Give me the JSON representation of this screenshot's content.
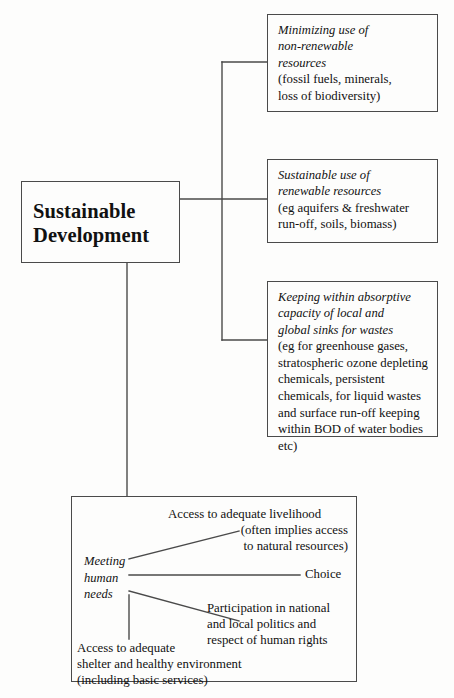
{
  "diagram": {
    "title": "Sustainable Development",
    "root": {
      "line1": "Sustainable",
      "line2": "Development"
    },
    "branches": [
      {
        "name": "minimizing-non-renewable",
        "heading": [
          "Minimizing use of",
          "non-renewable",
          "resources"
        ],
        "body": [
          "(fossil fuels, minerals,",
          "loss of biodiversity)"
        ]
      },
      {
        "name": "sustainable-renewable",
        "heading": [
          "Sustainable use of",
          "renewable resources"
        ],
        "body": [
          "(eg aquifers & freshwater",
          "run-off, soils, biomass)"
        ]
      },
      {
        "name": "absorptive-capacity",
        "heading": [
          "Keeping within absorptive",
          "capacity of local and",
          "global sinks for wastes"
        ],
        "body": [
          "(eg for greenhouse gases,",
          "stratospheric ozone depleting",
          "chemicals, persistent",
          "chemicals, for liquid wastes",
          "and surface run-off keeping",
          "within BOD of water bodies",
          "etc)"
        ]
      }
    ],
    "human_needs": {
      "hub": [
        "Meeting",
        "human",
        "needs"
      ],
      "items": [
        {
          "name": "livelihood",
          "lines": [
            "Access to adequate livelihood",
            "(often implies access",
            "to natural resources)"
          ]
        },
        {
          "name": "choice",
          "lines": [
            "Choice"
          ]
        },
        {
          "name": "participation",
          "lines": [
            "Participation in national",
            "and local politics and",
            "respect of human rights"
          ]
        },
        {
          "name": "shelter",
          "lines": [
            "Access to adequate",
            "shelter and healthy environment",
            "(including basic services)"
          ]
        }
      ]
    },
    "colors": {
      "stroke": "#4a4a4a",
      "text": "#111111",
      "background": "#fdfdfc"
    }
  }
}
